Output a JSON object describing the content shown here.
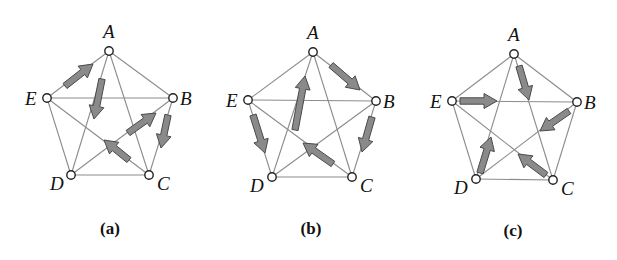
{
  "figure": {
    "style": {
      "edge_color": "#8c8c8c",
      "arrow_fill": "#8a8a8a",
      "arrow_stroke": "#4a4a4a",
      "node_fill": "#ffffff",
      "node_stroke": "#222222"
    },
    "panels": [
      {
        "caption": "(a)",
        "caption_pos": [
          110,
          234
        ],
        "nodes": {
          "A": {
            "label": "A",
            "x": 109,
            "y": 51,
            "lx": 103,
            "ly": 38
          },
          "B": {
            "label": "B",
            "x": 173,
            "y": 98,
            "lx": 180,
            "ly": 105
          },
          "C": {
            "label": "C",
            "x": 149,
            "y": 175,
            "lx": 157,
            "ly": 190
          },
          "D": {
            "label": "D",
            "x": 71,
            "y": 175,
            "lx": 50,
            "ly": 190
          },
          "E": {
            "label": "E",
            "x": 47,
            "y": 98,
            "lx": 25,
            "ly": 105
          }
        },
        "edges": [
          [
            "A",
            "B"
          ],
          [
            "B",
            "C"
          ],
          [
            "C",
            "D"
          ],
          [
            "D",
            "E"
          ],
          [
            "E",
            "A"
          ],
          [
            "A",
            "C"
          ],
          [
            "A",
            "D"
          ],
          [
            "B",
            "D"
          ],
          [
            "B",
            "E"
          ],
          [
            "C",
            "E"
          ]
        ],
        "arrows": [
          {
            "edge": "E→A",
            "from": [
              65,
              86
            ],
            "to": [
              93,
              64
            ]
          },
          {
            "edge": "A→D",
            "from": [
              102,
              79
            ],
            "to": [
              94,
              119
            ]
          },
          {
            "edge": "D→B",
            "from": [
              128,
              133
            ],
            "to": [
              156,
              113
            ]
          },
          {
            "edge": "B→C",
            "from": [
              168,
              115
            ],
            "to": [
              161,
              148
            ]
          },
          {
            "edge": "C→E",
            "from": [
              129,
              160
            ],
            "to": [
              104,
              140
            ]
          }
        ]
      },
      {
        "caption": "(b)",
        "caption_pos": [
          311,
          234
        ],
        "nodes": {
          "A": {
            "label": "A",
            "x": 313,
            "y": 52,
            "lx": 307,
            "ly": 39
          },
          "B": {
            "label": "B",
            "x": 376,
            "y": 101,
            "lx": 383,
            "ly": 108
          },
          "C": {
            "label": "C",
            "x": 352,
            "y": 177,
            "lx": 360,
            "ly": 192
          },
          "D": {
            "label": "D",
            "x": 272,
            "y": 177,
            "lx": 250,
            "ly": 192
          },
          "E": {
            "label": "E",
            "x": 248,
            "y": 100,
            "lx": 226,
            "ly": 107
          }
        },
        "edges": [
          [
            "A",
            "B"
          ],
          [
            "B",
            "C"
          ],
          [
            "C",
            "D"
          ],
          [
            "D",
            "E"
          ],
          [
            "E",
            "A"
          ],
          [
            "A",
            "C"
          ],
          [
            "A",
            "D"
          ],
          [
            "B",
            "D"
          ],
          [
            "B",
            "E"
          ],
          [
            "C",
            "E"
          ]
        ],
        "arrows": [
          {
            "edge": "A→B",
            "from": [
              331,
              65
            ],
            "to": [
              360,
              90
            ]
          },
          {
            "edge": "D→A",
            "from": [
              295,
              130
            ],
            "to": [
              305,
              76
            ]
          },
          {
            "edge": "E→D",
            "from": [
              253,
              115
            ],
            "to": [
              265,
              153
            ]
          },
          {
            "edge": "B→C",
            "from": [
              372,
              117
            ],
            "to": [
              362,
              152
            ]
          },
          {
            "edge": "C→E",
            "from": [
              333,
              164
            ],
            "to": [
              303,
              143
            ]
          }
        ]
      },
      {
        "caption": "(c)",
        "caption_pos": [
          513,
          236
        ],
        "nodes": {
          "A": {
            "label": "A",
            "x": 514,
            "y": 54,
            "lx": 508,
            "ly": 41
          },
          "B": {
            "label": "B",
            "x": 577,
            "y": 102,
            "lx": 584,
            "ly": 109
          },
          "C": {
            "label": "C",
            "x": 553,
            "y": 180,
            "lx": 561,
            "ly": 195
          },
          "D": {
            "label": "D",
            "x": 476,
            "y": 179,
            "lx": 454,
            "ly": 194
          },
          "E": {
            "label": "E",
            "x": 452,
            "y": 101,
            "lx": 430,
            "ly": 108
          }
        },
        "edges": [
          [
            "A",
            "B"
          ],
          [
            "B",
            "C"
          ],
          [
            "C",
            "D"
          ],
          [
            "D",
            "E"
          ],
          [
            "E",
            "A"
          ],
          [
            "A",
            "C"
          ],
          [
            "A",
            "D"
          ],
          [
            "B",
            "D"
          ],
          [
            "B",
            "E"
          ],
          [
            "C",
            "E"
          ]
        ],
        "arrows": [
          {
            "edge": "A→C",
            "from": [
              519,
              66
            ],
            "to": [
              529,
              100
            ]
          },
          {
            "edge": "E→B",
            "from": [
              460,
              101
            ],
            "to": [
              497,
              101
            ]
          },
          {
            "edge": "B→D",
            "from": [
              569,
              111
            ],
            "to": [
              540,
              131
            ]
          },
          {
            "edge": "C→E",
            "from": [
              546,
              175
            ],
            "to": [
              518,
              154
            ]
          },
          {
            "edge": "D→A",
            "from": [
              480,
              173
            ],
            "to": [
              491,
              137
            ]
          }
        ]
      }
    ]
  }
}
